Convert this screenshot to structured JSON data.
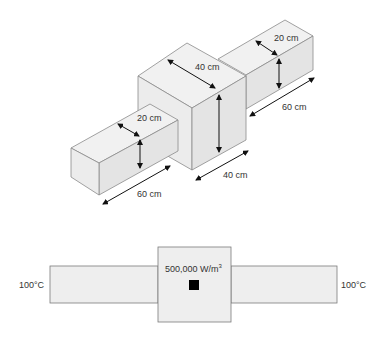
{
  "isometric_view": {
    "left_bar": {
      "width_label": "20 cm",
      "length_label": "60 cm"
    },
    "cube": {
      "width_label": "40 cm",
      "depth_label": "40 cm"
    },
    "right_bar": {
      "width_label": "20 cm",
      "length_label": "60 cm"
    }
  },
  "cross_section_view": {
    "left_temperature": "100°C",
    "right_temperature": "100°C",
    "heat_generation": "500,000 W/m",
    "heat_generation_exponent": "3",
    "colors": {
      "fill": "#eeeeee",
      "stroke": "#7a7a7a",
      "heat_source": "#000000"
    }
  }
}
